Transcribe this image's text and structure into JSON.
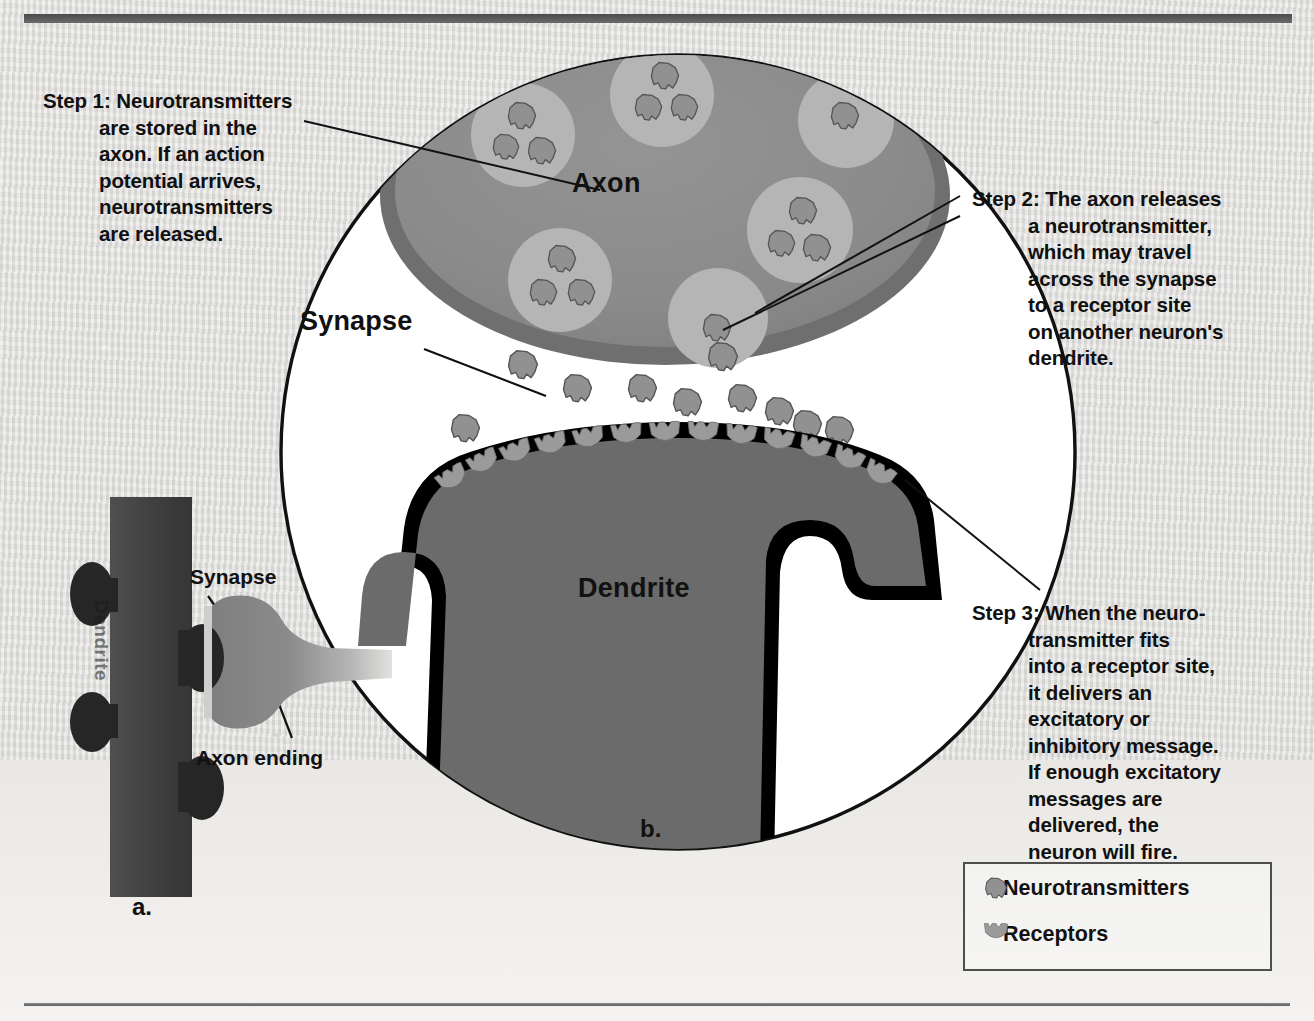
{
  "figure": {
    "panel_a_label": "a.",
    "panel_b_label": "b."
  },
  "callouts": [
    {
      "id": "step1",
      "label": "Step 1:",
      "text": "Step 1: Neurotransmitters\n          are stored in the\n          axon. If an action\n          potential arrives,\n          neurotransmitters\n          are released.",
      "plain": "Step 1: Neurotransmitters are stored in the axon. If an action potential arrives, neurotransmitters are released."
    },
    {
      "id": "step2",
      "label": "Step 2:",
      "text": "Step 2: The axon releases\n          a neurotransmitter,\n          which may travel\n          across the synapse\n          to a receptor site\n          on another neuron's\n          dendrite.",
      "plain": "Step 2: The axon releases a neurotransmitter, which may travel across the synapse to a receptor site on another neuron's dendrite."
    },
    {
      "id": "step3",
      "label": "Step 3:",
      "text": "Step 3: When the neuro-\n          transmitter fits\n          into a receptor site,\n          it delivers an\n          excitatory or\n          inhibitory message.\n          If enough excitatory\n          messages are\n          delivered, the\n          neuron will fire.",
      "plain": "Step 3: When the neurotransmitter fits into a receptor site, it delivers an excitatory or inhibitory message. If enough excitatory messages are delivered, the neuron will fire."
    }
  ],
  "main_diagram": {
    "axon_label": "Axon",
    "dendrite_label": "Dendrite",
    "synapse_label": "Synapse"
  },
  "inset_diagram": {
    "dendrite_label": "Dendrite",
    "synapse_label": "Synapse",
    "axon_ending_label": "Axon ending"
  },
  "legend": {
    "items": [
      {
        "icon": "neurotransmitter-icon",
        "label": "Neurotransmitters"
      },
      {
        "icon": "receptor-icon",
        "label": "Receptors"
      }
    ]
  },
  "colors": {
    "paper": "#e0dfdc",
    "circle_fill": "#ffffff",
    "circle_stroke": "#111111",
    "axon_fill": "#8b8b8b",
    "axon_rim": "#6e6e6e",
    "vesicle_fill": "#b3b3b3",
    "neurotransmitter_fill": "#919191",
    "neurotransmitter_stroke": "#5a5a5a",
    "dendrite_fill": "#6b6b6b",
    "dendrite_membrane": "#000000",
    "receptor_fill": "#9a9a9a",
    "inset_dendrite": "#4a4a4a",
    "inset_axon": "#8a8a8a",
    "text": "#111111"
  }
}
